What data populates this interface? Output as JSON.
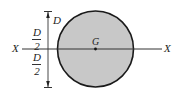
{
  "diagram": {
    "type": "circular-cross-section",
    "colors": {
      "fill": "#c8c8c8",
      "outline": "#1a1a1a",
      "axis": "#333333",
      "background": "#ffffff"
    },
    "labels": {
      "axis_left": "X",
      "axis_right": "X",
      "diameter": "D",
      "centroid": "G",
      "upper_half": {
        "numerator": "D",
        "denominator": "2"
      },
      "lower_half": {
        "numerator": "D",
        "denominator": "2"
      }
    }
  }
}
